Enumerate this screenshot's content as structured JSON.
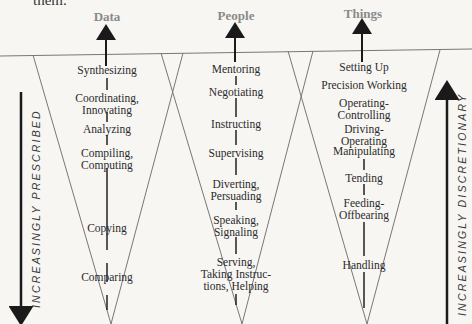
{
  "header_fragment": "them.",
  "columns": [
    {
      "title": "Data",
      "items": [
        "Synthesizing",
        "Coordinating,\nInnovating",
        "Analyzing",
        "Compiling,\nComputing",
        "Copying",
        "Comparing"
      ]
    },
    {
      "title": "People",
      "items": [
        "Mentoring",
        "Negotiating",
        "Instructing",
        "Supervising",
        "Diverting,\nPersuading",
        "Speaking,\nSignaling",
        "Serving,\nTaking Instruc-\ntions, Helping"
      ]
    },
    {
      "title": "Things",
      "items": [
        "Setting Up",
        "Precision Working",
        "Operating-\nControlling",
        "Driving-\nOperating",
        "Manipulating",
        "Tending",
        "Feeding-\nOffbearing",
        "Handling"
      ]
    }
  ],
  "left_axis_label": "INCREASINGLY PRESCRIBED",
  "right_axis_label": "INCREASINGLY DISCRETIONARY",
  "colors": {
    "title": "#8a8a8a",
    "line": "#555555",
    "arrow": "#1a1a1a"
  }
}
